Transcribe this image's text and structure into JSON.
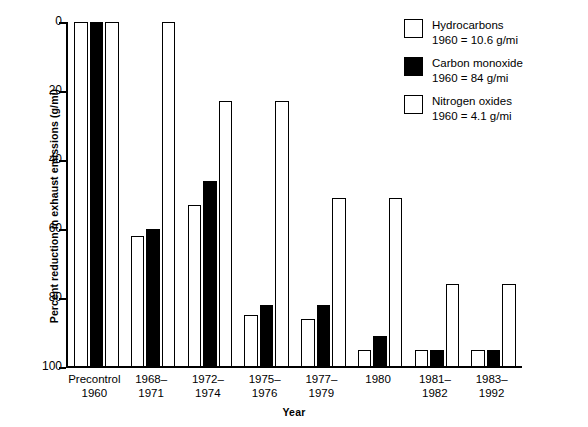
{
  "chart_data": {
    "type": "bar",
    "title": "",
    "xlabel": "Year",
    "ylabel": "Percent reduction in exhaust emissions (g/mi)",
    "ylim": [
      0,
      100
    ],
    "y_inverted": true,
    "yticks": [
      0,
      20,
      40,
      60,
      80,
      100
    ],
    "ytick_labels": [
      "0",
      "20",
      "40",
      "60",
      "80",
      "100"
    ],
    "grid": false,
    "legend_position": "top-right",
    "categories": [
      "Precontrol\n1960",
      "1968–\n1971",
      "1972–\n1974",
      "1975–\n1976",
      "1977–\n1979",
      "1980",
      "1981–\n1982",
      "1983–\n1992"
    ],
    "category_lines": [
      [
        "Precontrol",
        "1960"
      ],
      [
        "1968–",
        "1971"
      ],
      [
        "1972–",
        "1974"
      ],
      [
        "1975–",
        "1976"
      ],
      [
        "1977–",
        "1979"
      ],
      [
        "1980",
        ""
      ],
      [
        "1981–",
        "1982"
      ],
      [
        "1983–",
        "1992"
      ]
    ],
    "series": [
      {
        "name": "Hydrocarbons",
        "baseline_note": "1960 = 10.6 g/mi",
        "fill": "open",
        "color": "#ffffff",
        "values": [
          0,
          62,
          53,
          85,
          86,
          95,
          95,
          95
        ]
      },
      {
        "name": "Carbon monoxide",
        "baseline_note": "1960 = 84 g/mi",
        "fill": "filled",
        "color": "#000000",
        "values": [
          0,
          60,
          46,
          82,
          82,
          91,
          95,
          95
        ]
      },
      {
        "name": "Nitrogen oxides",
        "baseline_note": "1960 = 4.1 g/mi",
        "fill": "open",
        "color": "#ffffff",
        "values": [
          0,
          0,
          23,
          23,
          51,
          51,
          76,
          76
        ]
      }
    ]
  },
  "legend": {
    "items": [
      {
        "label": "Hydrocarbons",
        "value": "1960  =  10.6 g/mi",
        "fill": "open"
      },
      {
        "label": "Carbon monoxide",
        "value": "1960  =  84 g/mi",
        "fill": "filled"
      },
      {
        "label": "Nitrogen oxides",
        "value": "1960  =  4.1 g/mi",
        "fill": "open"
      }
    ]
  },
  "axes": {
    "x_title": "Year",
    "y_title": "Percent reduction in exhaust emissions (g/mi)"
  }
}
